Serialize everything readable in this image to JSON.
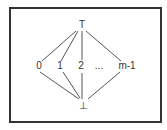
{
  "diagram": {
    "type": "lattice",
    "nodes": [
      {
        "id": "top",
        "label": "T",
        "x": 81,
        "y": 25
      },
      {
        "id": "n0",
        "label": "0",
        "x": 39,
        "y": 66
      },
      {
        "id": "n1",
        "label": "1",
        "x": 60,
        "y": 66
      },
      {
        "id": "n2",
        "label": "2",
        "x": 81,
        "y": 66
      },
      {
        "id": "ellipsis",
        "label": "...",
        "x": 98,
        "y": 66
      },
      {
        "id": "nm1",
        "label": "m-1",
        "x": 127,
        "y": 66
      },
      {
        "id": "bottom",
        "label": "⊥",
        "x": 83,
        "y": 105
      }
    ],
    "edges": [
      [
        "top",
        "n0"
      ],
      [
        "top",
        "n1"
      ],
      [
        "top",
        "n2"
      ],
      [
        "top",
        "nm1"
      ],
      [
        "n0",
        "bottom"
      ],
      [
        "n1",
        "bottom"
      ],
      [
        "n2",
        "bottom"
      ],
      [
        "nm1",
        "bottom"
      ]
    ],
    "colors": {
      "line": "#444444",
      "border": "#333333",
      "text": "#333333"
    }
  }
}
